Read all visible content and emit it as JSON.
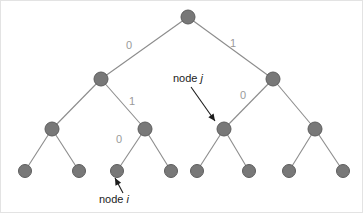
{
  "figure": {
    "background_color": "#ffffff",
    "border_color": "#e3e3e3",
    "node_fill_color": "#787878",
    "node_stroke_color": "#5d5d5d",
    "edge_color": "#8c8c8c",
    "edge_label_color": "#9a9a9a",
    "annotation_color": "#1c1c1c"
  },
  "tree": {
    "node_radius": 7,
    "leaf_radius": 6.5,
    "nodes": [
      {
        "id": "root",
        "label": "",
        "x": 187,
        "y": 16,
        "r": 7,
        "level": 0
      },
      {
        "id": "L",
        "label": "",
        "x": 100,
        "y": 78,
        "r": 7,
        "level": 1
      },
      {
        "id": "R",
        "label": "",
        "x": 272,
        "y": 78,
        "r": 7,
        "level": 1
      },
      {
        "id": "LL",
        "label": "",
        "x": 51,
        "y": 128,
        "r": 7,
        "level": 2
      },
      {
        "id": "LR",
        "label": "",
        "x": 144,
        "y": 128,
        "r": 7,
        "level": 2
      },
      {
        "id": "RL",
        "label": "",
        "x": 223,
        "y": 128,
        "r": 7,
        "level": 2
      },
      {
        "id": "RR",
        "label": "",
        "x": 314,
        "y": 128,
        "r": 7,
        "level": 2
      },
      {
        "id": "LLL",
        "label": "",
        "x": 24,
        "y": 170,
        "r": 6.5,
        "level": 3
      },
      {
        "id": "LLR",
        "label": "",
        "x": 78,
        "y": 170,
        "r": 6.5,
        "level": 3
      },
      {
        "id": "LRL",
        "label": "",
        "x": 116,
        "y": 170,
        "r": 6.5,
        "level": 3
      },
      {
        "id": "LRR",
        "label": "",
        "x": 170,
        "y": 170,
        "r": 6.5,
        "level": 3
      },
      {
        "id": "RLL",
        "label": "",
        "x": 196,
        "y": 170,
        "r": 6.5,
        "level": 3
      },
      {
        "id": "RLR",
        "label": "",
        "x": 248,
        "y": 170,
        "r": 6.5,
        "level": 3
      },
      {
        "id": "RRL",
        "label": "",
        "x": 288,
        "y": 170,
        "r": 6.5,
        "level": 3
      },
      {
        "id": "RRR",
        "label": "",
        "x": 342,
        "y": 170,
        "r": 6.5,
        "level": 3
      }
    ],
    "edges": [
      {
        "from": "root",
        "to": "L",
        "label": "0",
        "label_x": 128,
        "label_y": 45
      },
      {
        "from": "root",
        "to": "R",
        "label": "1",
        "label_x": 232,
        "label_y": 43
      },
      {
        "from": "L",
        "to": "LL",
        "label": "",
        "label_x": 0,
        "label_y": 0
      },
      {
        "from": "L",
        "to": "LR",
        "label": "1",
        "label_x": 131,
        "label_y": 101
      },
      {
        "from": "R",
        "to": "RL",
        "label": "0",
        "label_x": 242,
        "label_y": 95
      },
      {
        "from": "R",
        "to": "RR",
        "label": "",
        "label_x": 0,
        "label_y": 0
      },
      {
        "from": "LL",
        "to": "LLL",
        "label": "",
        "label_x": 0,
        "label_y": 0
      },
      {
        "from": "LL",
        "to": "LLR",
        "label": "",
        "label_x": 0,
        "label_y": 0
      },
      {
        "from": "LR",
        "to": "LRL",
        "label": "0",
        "label_x": 118,
        "label_y": 139
      },
      {
        "from": "LR",
        "to": "LRR",
        "label": "",
        "label_x": 0,
        "label_y": 0
      },
      {
        "from": "RL",
        "to": "RLL",
        "label": "",
        "label_x": 0,
        "label_y": 0
      },
      {
        "from": "RL",
        "to": "RLR",
        "label": "",
        "label_x": 0,
        "label_y": 0
      },
      {
        "from": "RR",
        "to": "RRL",
        "label": "",
        "label_x": 0,
        "label_y": 0
      },
      {
        "from": "RR",
        "to": "RRR",
        "label": "",
        "label_x": 0,
        "label_y": 0
      }
    ]
  },
  "annotations": [
    {
      "id": "node-j",
      "text_prefix": "node ",
      "text_italic": "j",
      "text_x": 172,
      "text_y": 78,
      "leader_start_x": 190,
      "leader_start_y": 86,
      "leader_end_x": 214,
      "leader_end_y": 120,
      "target_node": "RL"
    },
    {
      "id": "node-i",
      "text_prefix": "node ",
      "text_italic": "i",
      "text_x": 98,
      "text_y": 199,
      "leader_start_x": 122,
      "leader_start_y": 192,
      "leader_end_x": 114,
      "leader_end_y": 177,
      "target_node": "LRL"
    }
  ]
}
